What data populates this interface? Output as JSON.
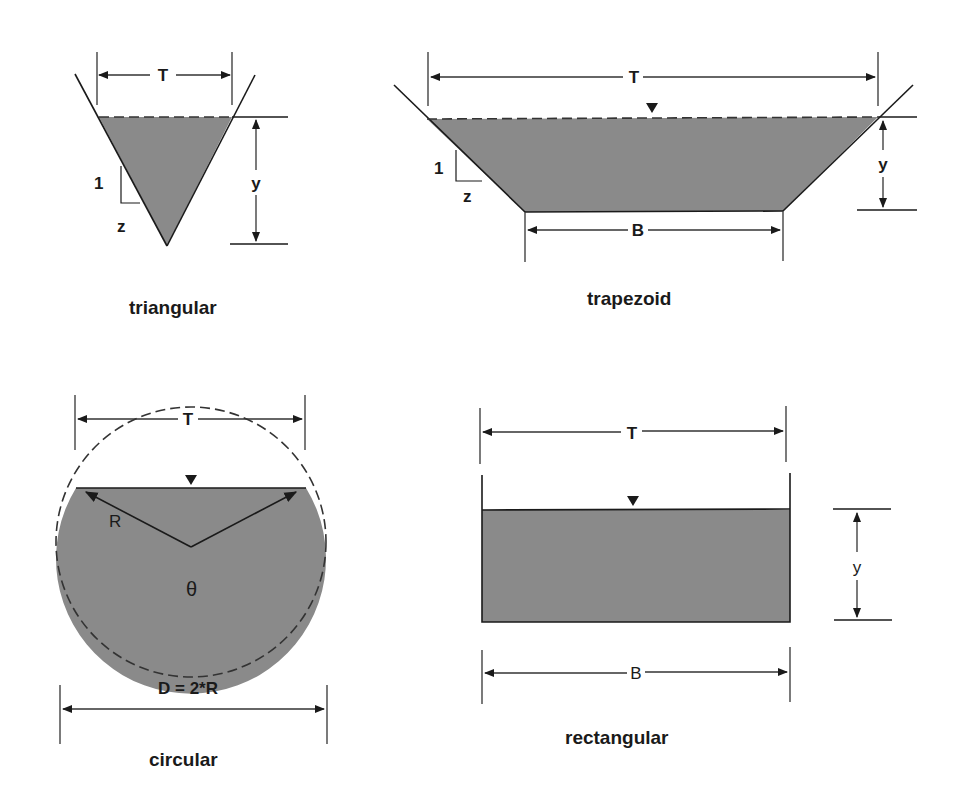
{
  "figure": {
    "fill_color": "#8a8a8a",
    "line_color": "#1a1a1a"
  },
  "diagrams": {
    "triangular": {
      "caption": "triangular",
      "top_width_label": "T",
      "depth_label": "y",
      "slope_vertical_label": "1",
      "slope_horizontal_label": "z"
    },
    "trapezoid": {
      "caption": "trapezoid",
      "top_width_label": "T",
      "bottom_width_label": "B",
      "depth_label": "y",
      "slope_vertical_label": "1",
      "slope_horizontal_label": "z"
    },
    "circular": {
      "caption": "circular",
      "top_width_label": "T",
      "radius_label": "R",
      "angle_label": "θ",
      "diameter_label": "D = 2*R"
    },
    "rectangular": {
      "caption": "rectangular",
      "top_width_label": "T",
      "bottom_width_label": "B",
      "depth_label": "y"
    }
  }
}
